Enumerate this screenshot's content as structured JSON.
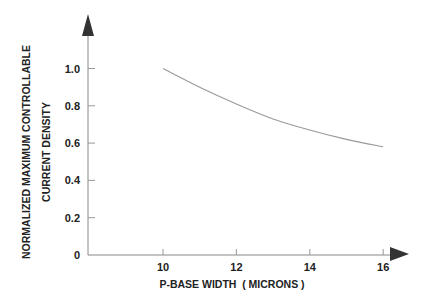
{
  "chart_data": {
    "type": "line",
    "title": "",
    "xlabel": "P-BASE WIDTH  ( MICRONS )",
    "ylabel_line1": "NORMALIZED MAXIMUM CONTROLLABLE",
    "ylabel_line2": "CURRENT DENSITY",
    "xlim": [
      8,
      17
    ],
    "ylim": [
      0,
      1.2
    ],
    "x_ticks": [
      10,
      12,
      14,
      16
    ],
    "x_tick_labels": [
      "10",
      "12",
      "14",
      "16"
    ],
    "y_ticks": [
      0,
      0.2,
      0.4,
      0.6,
      0.8,
      1.0
    ],
    "y_tick_labels": [
      "0",
      "0.2",
      "0.4",
      "0.6",
      "0.8",
      "1.0"
    ],
    "grid": false,
    "legend": null,
    "series": [
      {
        "name": "max controllable current density",
        "x": [
          10,
          11,
          12,
          13,
          14,
          15,
          16
        ],
        "values": [
          1.0,
          0.9,
          0.81,
          0.73,
          0.67,
          0.62,
          0.58
        ]
      }
    ]
  }
}
